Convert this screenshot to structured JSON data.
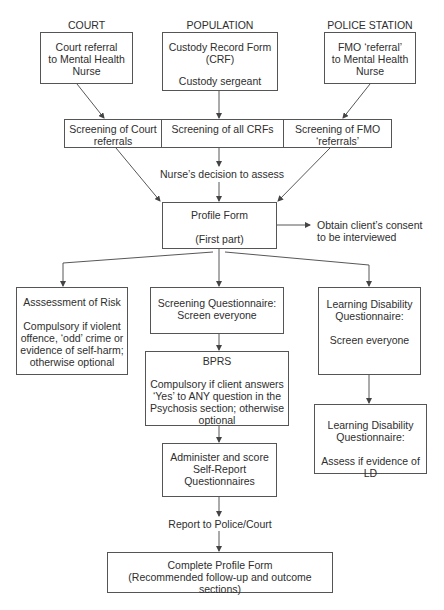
{
  "columns": {
    "court": "COURT",
    "population": "POPULATION",
    "police_station": "POLICE STATION"
  },
  "sources": {
    "court": [
      "Court referral",
      "to Mental Health",
      "Nurse"
    ],
    "population": [
      "Custody Record Form",
      "(CRF)",
      "Custody sergeant"
    ],
    "police": [
      "FMO ‘referral’",
      "to Mental Health",
      "Nurse"
    ]
  },
  "screening": {
    "court": [
      "Screening of Court",
      "referrals"
    ],
    "all": [
      "Screening of all CRFs"
    ],
    "fmo": [
      "Screening of FMO",
      "‘referrals’"
    ]
  },
  "decision_label": "Nurse’s decision to assess",
  "profile_form": {
    "title": "Profile Form",
    "subtitle": "(First part)"
  },
  "consent_label": [
    "Obtain client’s consent",
    "to be interviewed"
  ],
  "risk": {
    "title": "Asssessment of Risk",
    "body": [
      "Compulsory if violent",
      "offence, ‘odd’ crime or",
      "evidence of self-harm;",
      "otherwise optional"
    ]
  },
  "screening_questionnaire": [
    "Screening Questionnaire:",
    "Screen everyone"
  ],
  "bprs": {
    "title": "BPRS",
    "body": [
      "Compulsory if client answers",
      "‘Yes’ to ANY question in the",
      "Psychosis section; otherwise",
      "optional"
    ]
  },
  "administer": [
    "Administer and score",
    "Self-Report",
    "Questionnaires"
  ],
  "ld_screen": {
    "title": [
      "Learning Disability",
      "Questionnaire:"
    ],
    "body": "Screen everyone"
  },
  "ld_assess": {
    "title": [
      "Learning Disability",
      "Questionnaire:"
    ],
    "body": "Assess if evidence of LD"
  },
  "report_label": "Report to Police/Court",
  "complete_form": [
    "Complete Profile Form",
    "(Recommended follow-up and outcome sections)"
  ],
  "colors": {
    "line": "#444444",
    "border": "#555555",
    "text": "#2e2e2e"
  }
}
